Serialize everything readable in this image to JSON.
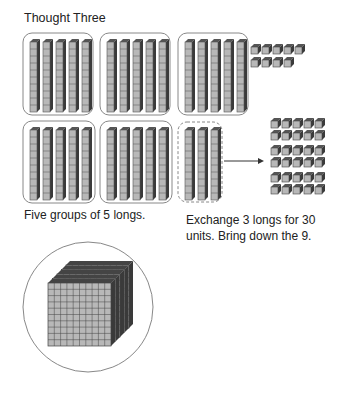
{
  "title": "Thought Three",
  "captions": {
    "left": "Five groups of 5 longs.",
    "right_line1": "Exchange 3 longs for 30",
    "right_line2": "units. Bring down the 9."
  },
  "figure": {
    "top_row": {
      "groups_of_longs": 3,
      "longs_per_group": 5,
      "loose_units": 9
    },
    "bottom_row": {
      "groups_of_longs": 2,
      "longs_per_group": 5,
      "exchanged_longs": 3,
      "resulting_units": 30
    },
    "flats_stack": 5
  },
  "colors": {
    "cube_face": "#b8b8b8",
    "cube_side": "#3a3a3a",
    "cube_top": "#555555",
    "outline": "#888888"
  }
}
